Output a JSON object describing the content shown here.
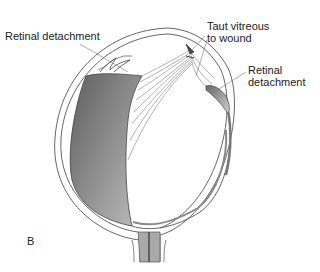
{
  "figure": {
    "panel_letter": "B",
    "labels": {
      "retinal_detachment_left": "Retinal detachment",
      "taut_vitreous_line1": "Taut vitreous",
      "taut_vitreous_line2": "to wound",
      "retinal_detachment_right_line1": "Retinal",
      "retinal_detachment_right_line2": "detachment"
    },
    "colors": {
      "background": "#ffffff",
      "outline": "#444444",
      "detached_retina_fill_dark": "#6e6e6e",
      "detached_retina_fill_light": "#b5b5b5",
      "optic_nerve_fill": "#a8a8a8",
      "label_text": "#222222"
    }
  }
}
